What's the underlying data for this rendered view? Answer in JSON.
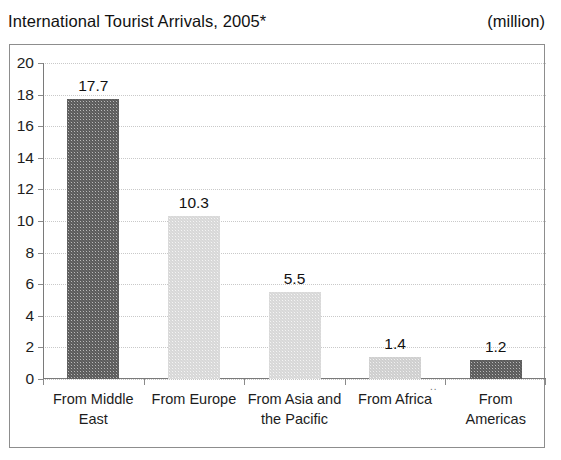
{
  "header": {
    "title": "International Tourist Arrivals, 2005*",
    "units": "(million)"
  },
  "chart_data": {
    "type": "bar",
    "title": "International Tourist Arrivals, 2005*",
    "xlabel": "",
    "ylabel": "",
    "units": "million",
    "categories": [
      "From Middle East",
      "From Europe",
      "From Asia and the Pacific",
      "From Africa",
      "From Americas"
    ],
    "category_lines": [
      [
        "From Middle",
        "East"
      ],
      [
        "From Europe"
      ],
      [
        "From Asia and",
        "the Pacific"
      ],
      [
        "From Africa"
      ],
      [
        "From",
        "Americas"
      ]
    ],
    "values": [
      17.7,
      10.3,
      5.5,
      1.4,
      1.2
    ],
    "value_labels": [
      "17.7",
      "10.3",
      "5.5",
      "1.4",
      "1.2"
    ],
    "ylim": [
      0,
      20
    ],
    "ytick_step": 2,
    "yticks": [
      "20",
      "18",
      "16",
      "14",
      "12",
      "10",
      "8",
      "6",
      "4",
      "2",
      "0"
    ],
    "grid": true,
    "legend": "none",
    "bar_fills": [
      "dark",
      "light",
      "light",
      "mid",
      "dark"
    ],
    "colors": {
      "bar_dark": "#666666",
      "bar_light": "#e8e8e8",
      "bar_mid": "#dcdcdc",
      "gridline": "#c9c9c9",
      "axis": "#7a7a7a",
      "frame": "#8d8d8d",
      "text": "#1a1a1a"
    },
    "footnote_marker": "*"
  }
}
